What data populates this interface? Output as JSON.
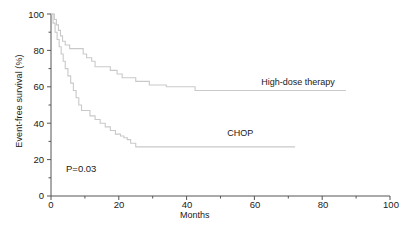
{
  "chart_data": {
    "type": "line",
    "subtype": "kaplan-meier-step",
    "title": "",
    "xlabel": "Months",
    "ylabel": "Event-free survival (%)",
    "xlim": [
      0,
      100
    ],
    "ylim": [
      0,
      100
    ],
    "xticks": [
      0,
      20,
      40,
      60,
      80,
      100
    ],
    "yticks": [
      0,
      20,
      40,
      60,
      80,
      100
    ],
    "xminor_ticks": [
      10,
      30,
      50,
      70,
      90
    ],
    "yminor_ticks": [
      10,
      30,
      50,
      70,
      90
    ],
    "grid": false,
    "legend_position": "inline-right",
    "annotations": [
      {
        "text": "P=0.03",
        "x": 8,
        "y": 12
      }
    ],
    "series": [
      {
        "name": "High-dose therapy",
        "color": "#c9c9c9",
        "label_x": 62,
        "label_y": 62,
        "points": [
          [
            0,
            100
          ],
          [
            1.0,
            97
          ],
          [
            1.6,
            94
          ],
          [
            2.2,
            91
          ],
          [
            2.8,
            88
          ],
          [
            3.4,
            85
          ],
          [
            4.2,
            83
          ],
          [
            5.5,
            81
          ],
          [
            8.0,
            81
          ],
          [
            9.5,
            78
          ],
          [
            10.5,
            76
          ],
          [
            12.0,
            74
          ],
          [
            13.0,
            71
          ],
          [
            16.0,
            71
          ],
          [
            17.5,
            69
          ],
          [
            19.5,
            67
          ],
          [
            21.0,
            65
          ],
          [
            23.0,
            65
          ],
          [
            25.0,
            63
          ],
          [
            27.5,
            63
          ],
          [
            29.0,
            61
          ],
          [
            32.0,
            61
          ],
          [
            34.0,
            60
          ],
          [
            42.0,
            60
          ],
          [
            42.5,
            58
          ],
          [
            87.0,
            58
          ]
        ]
      },
      {
        "name": "CHOP",
        "color": "#c9c9c9",
        "label_x": 52,
        "label_y": 34,
        "points": [
          [
            0,
            100
          ],
          [
            0.6,
            95
          ],
          [
            1.2,
            90
          ],
          [
            1.8,
            86
          ],
          [
            2.4,
            82
          ],
          [
            3.0,
            78
          ],
          [
            3.6,
            74
          ],
          [
            4.2,
            70
          ],
          [
            5.0,
            66
          ],
          [
            5.8,
            62
          ],
          [
            6.6,
            58
          ],
          [
            7.4,
            54
          ],
          [
            8.2,
            50
          ],
          [
            9.0,
            47
          ],
          [
            10.5,
            47
          ],
          [
            11.5,
            44
          ],
          [
            13.0,
            42
          ],
          [
            14.5,
            40
          ],
          [
            16.0,
            38
          ],
          [
            17.5,
            36
          ],
          [
            19.0,
            34
          ],
          [
            20.5,
            33
          ],
          [
            21.5,
            32
          ],
          [
            22.5,
            31
          ],
          [
            23.5,
            29
          ],
          [
            25.0,
            27
          ],
          [
            72.0,
            27
          ]
        ]
      }
    ]
  },
  "axes": {
    "y_tick_labels": [
      "100",
      "80",
      "60",
      "40",
      "20",
      "0"
    ],
    "x_tick_labels": [
      "0",
      "20",
      "40",
      "60",
      "80",
      "100"
    ],
    "axis_color": "#555555"
  }
}
